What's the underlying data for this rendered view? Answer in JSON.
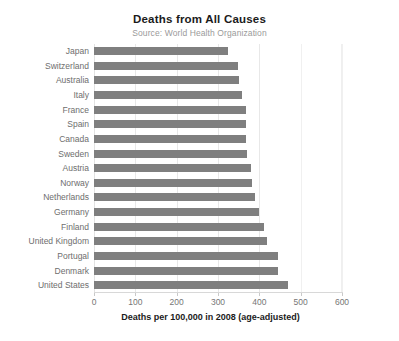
{
  "chart_data": {
    "type": "bar",
    "orientation": "horizontal",
    "title": "Deaths from All Causes",
    "subtitle": "Source: World Health Organization",
    "xlabel": "Deaths per 100,000 in 2008 (age-adjusted)",
    "ylabel": "",
    "xlim": [
      0,
      600
    ],
    "ylim": null,
    "xticks": [
      0,
      100,
      200,
      300,
      400,
      500,
      600
    ],
    "xtick_labels": [
      "0",
      "100",
      "200",
      "300",
      "400",
      "500",
      "600"
    ],
    "grid": "vertical",
    "legend": "none",
    "bar_color": "#7f7f7f",
    "categories": [
      "Japan",
      "Switzerland",
      "Australia",
      "Italy",
      "France",
      "Spain",
      "Canada",
      "Sweden",
      "Austria",
      "Norway",
      "Netherlands",
      "Germany",
      "Finland",
      "United Kingdom",
      "Portugal",
      "Denmark",
      "United States"
    ],
    "values": [
      325,
      348,
      350,
      358,
      367,
      367,
      368,
      371,
      381,
      383,
      390,
      400,
      412,
      419,
      444,
      444,
      470
    ],
    "series": [
      {
        "name": "Deaths per 100,000 in 2008 (age-adjusted)",
        "values": [
          325,
          348,
          350,
          358,
          367,
          367,
          368,
          371,
          381,
          383,
          390,
          400,
          412,
          419,
          444,
          444,
          470
        ]
      }
    ]
  }
}
